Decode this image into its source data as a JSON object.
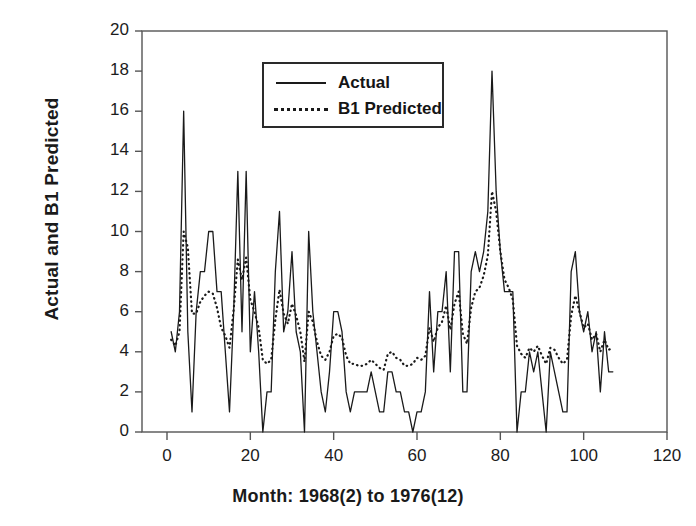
{
  "chart_data": {
    "type": "line",
    "title": "",
    "xlabel": "Month: 1968(2) to 1976(12)",
    "ylabel": "Actual and B1 Predicted",
    "xlim": [
      -6,
      120
    ],
    "ylim": [
      0,
      20
    ],
    "xticks": [
      0,
      20,
      40,
      60,
      80,
      100,
      120
    ],
    "yticks": [
      0,
      2,
      4,
      6,
      8,
      10,
      12,
      14,
      16,
      18,
      20
    ],
    "grid": false,
    "legend_position": "top-center",
    "x": [
      1,
      2,
      3,
      4,
      5,
      6,
      7,
      8,
      9,
      10,
      11,
      12,
      13,
      14,
      15,
      16,
      17,
      18,
      19,
      20,
      21,
      22,
      23,
      24,
      25,
      26,
      27,
      28,
      29,
      30,
      31,
      32,
      33,
      34,
      35,
      36,
      37,
      38,
      39,
      40,
      41,
      42,
      43,
      44,
      45,
      46,
      47,
      48,
      49,
      50,
      51,
      52,
      53,
      54,
      55,
      56,
      57,
      58,
      59,
      60,
      61,
      62,
      63,
      64,
      65,
      66,
      67,
      68,
      69,
      70,
      71,
      72,
      73,
      74,
      75,
      76,
      77,
      78,
      79,
      80,
      81,
      82,
      83,
      84,
      85,
      86,
      87,
      88,
      89,
      90,
      91,
      92,
      93,
      94,
      95,
      96,
      97,
      98,
      99,
      100,
      101,
      102,
      103,
      104,
      105,
      106,
      107
    ],
    "series": [
      {
        "name": "Actual",
        "style": "solid",
        "color": "#1a1a1a",
        "values": [
          5,
          4,
          6,
          16,
          5,
          1,
          6,
          8,
          8,
          10,
          10,
          7,
          7,
          4,
          1,
          6,
          13,
          5,
          13,
          4,
          7,
          4,
          0,
          2,
          2,
          8,
          11,
          5,
          6,
          9,
          5,
          4,
          0,
          10,
          6,
          4,
          2,
          1,
          3,
          6,
          6,
          5,
          2,
          1,
          2,
          2,
          2,
          2,
          3,
          2,
          1,
          1,
          3,
          3,
          2,
          2,
          1,
          1,
          0,
          1,
          1,
          2,
          7,
          3,
          6,
          6,
          8,
          3,
          9,
          9,
          2,
          2,
          8,
          9,
          8,
          9,
          11,
          18,
          12,
          9,
          7,
          7,
          7,
          0,
          2,
          2,
          4,
          3,
          4,
          2,
          0,
          4,
          3,
          2,
          1,
          1,
          8,
          9,
          6,
          5,
          6,
          4,
          5,
          2,
          5,
          3,
          3
        ]
      },
      {
        "name": "B1 Predicted",
        "style": "dotted",
        "color": "#1a1a1a",
        "values": [
          4.6,
          4.3,
          5.0,
          10.0,
          9.2,
          5.9,
          5.9,
          6.5,
          6.8,
          7.0,
          6.9,
          6.2,
          5.2,
          4.8,
          4.2,
          6.1,
          8.6,
          7.6,
          8.7,
          6.6,
          6.0,
          5.2,
          3.6,
          3.4,
          3.6,
          5.6,
          7.1,
          5.9,
          5.4,
          6.4,
          5.8,
          5.0,
          3.5,
          6.0,
          5.5,
          4.5,
          3.8,
          3.6,
          4.0,
          4.8,
          4.9,
          4.7,
          3.8,
          3.4,
          3.4,
          3.3,
          3.3,
          3.4,
          3.6,
          3.4,
          3.2,
          3.1,
          3.9,
          4.0,
          3.7,
          3.6,
          3.3,
          3.3,
          3.4,
          3.7,
          3.6,
          3.8,
          5.2,
          4.5,
          5.2,
          5.5,
          6.3,
          5.1,
          6.4,
          7.0,
          4.9,
          4.4,
          6.2,
          7.0,
          7.2,
          7.8,
          8.8,
          12.0,
          11.0,
          9.0,
          7.6,
          7.2,
          6.6,
          4.3,
          3.9,
          3.7,
          4.2,
          4.0,
          4.3,
          3.8,
          3.4,
          4.2,
          4.1,
          3.7,
          3.4,
          3.6,
          5.8,
          6.8,
          6.0,
          5.2,
          5.4,
          4.6,
          4.9,
          4.0,
          4.6,
          4.1,
          4.2
        ]
      }
    ]
  },
  "legend": {
    "entries": [
      {
        "label": "Actual",
        "style": "solid"
      },
      {
        "label": "B1 Predicted",
        "style": "dotted"
      }
    ]
  },
  "axes": {
    "y_title": "Actual and B1 Predicted",
    "x_title": "Month: 1968(2) to 1976(12)",
    "y_tick_labels": [
      "20",
      "18",
      "16",
      "14",
      "12",
      "10",
      "8",
      "6",
      "4",
      "2",
      "0"
    ],
    "x_tick_labels": [
      "0",
      "20",
      "40",
      "60",
      "80",
      "100",
      "120"
    ]
  },
  "colors": {
    "line": "#1a1a1a",
    "axis": "#555555",
    "background": "#ffffff"
  }
}
